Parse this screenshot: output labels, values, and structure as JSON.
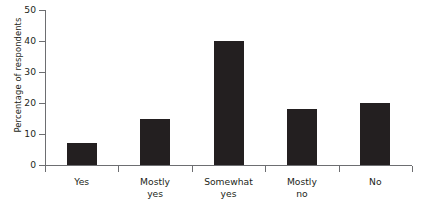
{
  "chart_data": {
    "type": "bar",
    "title": "",
    "subtitle": "",
    "xlabel": "",
    "ylabel": "Percentage of respondents",
    "categories": [
      "Yes",
      "Mostly yes",
      "Somewhat yes",
      "Mostly no",
      "No"
    ],
    "category_lines": [
      [
        "Yes"
      ],
      [
        "Mostly",
        "yes"
      ],
      [
        "Somewhat",
        "yes"
      ],
      [
        "Mostly",
        "no"
      ],
      [
        "No"
      ]
    ],
    "values": [
      7,
      15,
      40,
      18,
      20
    ],
    "ylim": [
      0,
      50
    ],
    "ytick_labels": [
      "0",
      "10",
      "20",
      "30",
      "40",
      "50"
    ],
    "ytick_values": [
      0,
      10,
      20,
      30,
      40,
      50
    ],
    "grid": false,
    "legend": false,
    "legend_position": "none",
    "bar_color": "#231f20",
    "axis_color": "#6d6e71",
    "background_color": "#ffffff"
  }
}
